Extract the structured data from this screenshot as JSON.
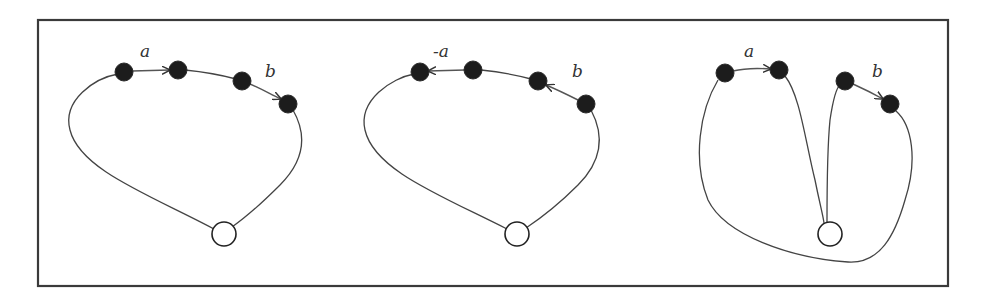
{
  "figure": {
    "frame": {
      "x": 38,
      "y": 20,
      "width": 910,
      "height": 266
    },
    "panels": [
      {
        "id": "panel-1",
        "label_a": "a",
        "label_b": "b",
        "arrow_a_direction": "right",
        "arrow_b_direction": "forward",
        "nodes_filled": [
          [
            124,
            72
          ],
          [
            178,
            70
          ],
          [
            242,
            81
          ],
          [
            288,
            104
          ]
        ],
        "node_open": [
          224,
          234
        ]
      },
      {
        "id": "panel-2",
        "label_a": "-a",
        "label_b": "b",
        "arrow_a_direction": "left",
        "arrow_b_direction": "backward",
        "nodes_filled": [
          [
            420,
            72
          ],
          [
            473,
            70
          ],
          [
            538,
            81
          ],
          [
            586,
            104
          ]
        ],
        "node_open": [
          517,
          234
        ]
      },
      {
        "id": "panel-3",
        "label_a": "a",
        "label_b": "b",
        "arrow_a_direction": "right",
        "arrow_b_direction": "forward",
        "nodes_filled": [
          [
            725,
            73
          ],
          [
            779,
            70
          ],
          [
            845,
            81
          ],
          [
            890,
            104
          ]
        ],
        "node_open": [
          830,
          234
        ]
      }
    ],
    "colors": {
      "frame": "#3a3a3a",
      "curve": "#444444",
      "node_fill": "#1c1c1c",
      "background": "#ffffff"
    }
  }
}
